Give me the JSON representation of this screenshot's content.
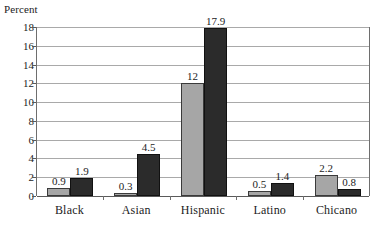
{
  "chart_data": {
    "type": "bar",
    "title": "",
    "subtitle": "",
    "xlabel": "",
    "ylabel": "Percent",
    "ylim": [
      0,
      18
    ],
    "ytick_step": 2,
    "yticks": [
      0,
      2,
      4,
      6,
      8,
      10,
      12,
      14,
      16,
      18
    ],
    "ytick_labels": [
      "0",
      "2",
      "4",
      "6",
      "8",
      "10",
      "12",
      "14",
      "16",
      "18"
    ],
    "grid": true,
    "legend": "none",
    "categories": [
      "Black",
      "Asian",
      "Hispanic",
      "Latino",
      "Chicano"
    ],
    "series": [
      {
        "name": "series-a",
        "color": "#a6a6a6",
        "values": [
          0.9,
          0.3,
          12,
          0.5,
          2.2
        ],
        "labels": [
          "0.9",
          "0.3",
          "12",
          "0.5",
          "2.2"
        ]
      },
      {
        "name": "series-b",
        "color": "#2b2b2b",
        "values": [
          1.9,
          4.5,
          17.9,
          1.4,
          0.8
        ],
        "labels": [
          "1.9",
          "4.5",
          "17.9",
          "1.4",
          "0.8"
        ]
      }
    ]
  },
  "colors": {
    "series_a": "#a6a6a6",
    "series_b": "#2b2b2b",
    "gridline": "#a9a9a9",
    "axis": "#5a5a5a",
    "text": "#1c1c1c",
    "background": "#ffffff"
  }
}
